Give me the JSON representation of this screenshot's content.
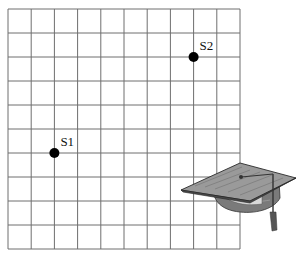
{
  "grid": {
    "columns": 10,
    "rows": 10,
    "left": 8,
    "top": 9,
    "cell_width": 23.2,
    "cell_height": 24,
    "line_color": "#6e6e6e"
  },
  "points": [
    {
      "label": "S1",
      "col": 2,
      "row": 6,
      "color": "#000000"
    },
    {
      "label": "S2",
      "col": 8,
      "row": 2,
      "color": "#000000"
    }
  ],
  "decoration": {
    "icon": "graduation-cap-icon"
  }
}
